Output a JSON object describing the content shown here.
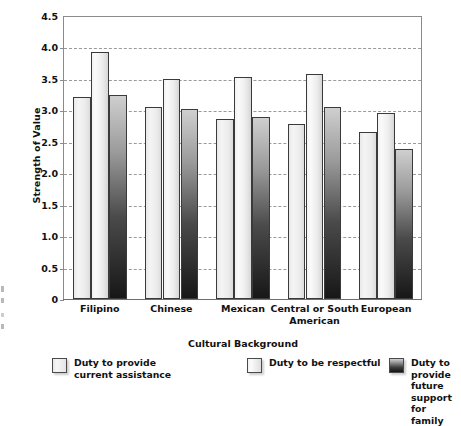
{
  "chart_data": {
    "type": "bar",
    "title": "",
    "xlabel": "Cultural Background",
    "ylabel": "Strength of Value",
    "ylim": [
      0,
      4.5
    ],
    "ytick_step": 0.5,
    "yticks": [
      "4.5",
      "4.0",
      "3.5",
      "3.0",
      "2.5",
      "2.0",
      "1.5",
      "1.0",
      "0.5",
      "0"
    ],
    "ytick_values": [
      4.5,
      4.0,
      3.5,
      3.0,
      2.5,
      2.0,
      1.5,
      1.0,
      0.5,
      0
    ],
    "grid": "horizontal-dashed",
    "legend_position": "bottom",
    "categories": [
      "Filipino",
      "Chinese",
      "Mexican",
      "Central or South\nAmerican",
      "European"
    ],
    "series": [
      {
        "name": "Duty to provide\ncurrent assistance",
        "values": [
          3.22,
          3.05,
          2.86,
          2.78,
          2.65
        ],
        "color": "#ededed"
      },
      {
        "name": "Duty to be respectful",
        "values": [
          3.92,
          3.5,
          3.53,
          3.58,
          2.95
        ],
        "color": "#f2f2f2"
      },
      {
        "name": "Duty to provide future\nsupport for family",
        "values": [
          3.25,
          3.02,
          2.89,
          3.05,
          2.39
        ],
        "color": "#2b2b2b"
      }
    ]
  },
  "axes": {
    "y_title": "Strength of Value",
    "x_title": "Cultural Background"
  },
  "legend": {
    "items": [
      {
        "label": "Duty to provide\ncurrent assistance",
        "swatch": "light-gray-swatch"
      },
      {
        "label": "Duty to be respectful",
        "swatch": "light-gray-swatch"
      },
      {
        "label": "Duty to provide future\nsupport for family",
        "swatch": "dark-gradient-swatch"
      }
    ]
  }
}
